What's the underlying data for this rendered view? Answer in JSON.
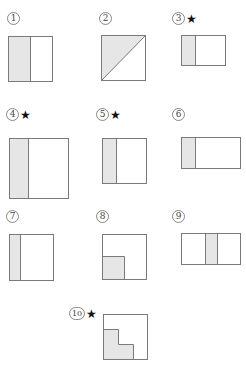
{
  "colors": {
    "shade": "#e6e6e6",
    "stroke": "#7a7a7a",
    "background": "#ffffff"
  },
  "figures": [
    {
      "id": 1,
      "label": "1",
      "starred": false,
      "star": "",
      "description": "Square, left half shaded"
    },
    {
      "id": 2,
      "label": "2",
      "starred": false,
      "star": "",
      "description": "Square split by diagonal, upper-left triangle shaded"
    },
    {
      "id": 3,
      "label": "3",
      "starred": true,
      "star": "★",
      "description": "Rectangle, left third shaded"
    },
    {
      "id": 4,
      "label": "4",
      "starred": true,
      "star": "★",
      "description": "Large square, left third shaded"
    },
    {
      "id": 5,
      "label": "5",
      "starred": true,
      "star": "★",
      "description": "Square, left third shaded"
    },
    {
      "id": 6,
      "label": "6",
      "starred": false,
      "star": "",
      "description": "Wide rectangle, left quarter shaded"
    },
    {
      "id": 7,
      "label": "7",
      "starred": false,
      "star": "",
      "description": "Square, left quarter shaded"
    },
    {
      "id": 8,
      "label": "8",
      "starred": false,
      "star": "",
      "description": "Square, bottom-left quarter shaded"
    },
    {
      "id": 9,
      "label": "9",
      "starred": false,
      "star": "",
      "description": "Wide rectangle, middle fifth shaded"
    },
    {
      "id": 10,
      "label": "10",
      "starred": true,
      "star": "★",
      "description": "Square, L-shaped staircase region shaded in lower-left"
    }
  ]
}
